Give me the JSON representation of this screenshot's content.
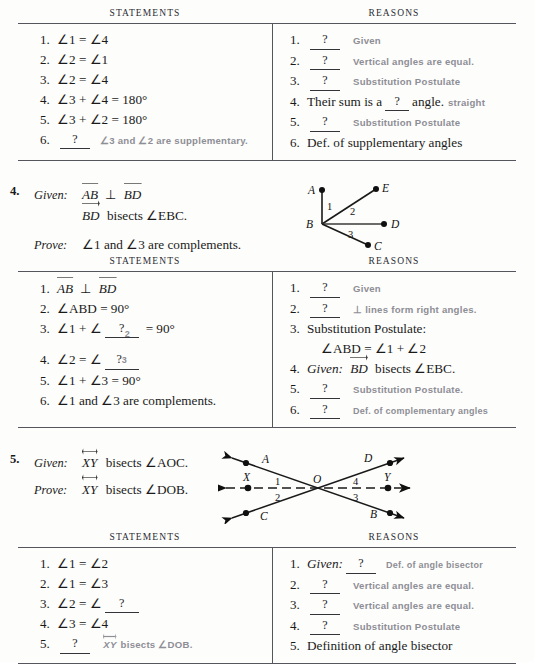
{
  "table_headers": {
    "statements": "STATEMENTS",
    "reasons": "REASONS"
  },
  "proof1": {
    "statements": [
      {
        "num": "1.",
        "text": "∠1 = ∠4"
      },
      {
        "num": "2.",
        "text": "∠2 = ∠1"
      },
      {
        "num": "3.",
        "text": "∠2 = ∠4"
      },
      {
        "num": "4.",
        "text": "∠3 + ∠4 = 180°"
      },
      {
        "num": "5.",
        "text": "∠3 + ∠2 = 180°"
      },
      {
        "num": "6.",
        "blank": "?",
        "answer": "∠3 and ∠2 are supplementary."
      }
    ],
    "reasons": [
      {
        "num": "1.",
        "blank": "?",
        "answer": "Given"
      },
      {
        "num": "2.",
        "blank": "?",
        "answer": "Vertical angles are equal."
      },
      {
        "num": "3.",
        "blank": "?",
        "answer": "Substitution Postulate"
      },
      {
        "num": "4.",
        "pre": "Their sum is a",
        "blank": "?",
        "post": "angle.",
        "answer": "straight"
      },
      {
        "num": "5.",
        "blank": "?",
        "answer": "Substitution Postulate"
      },
      {
        "num": "6.",
        "text": "Def. of supplementary angles"
      }
    ]
  },
  "problem4": {
    "number": "4.",
    "given_label": "Given:",
    "given_line1_a": "AB",
    "given_line1_perp": "⊥",
    "given_line1_b": "BD",
    "given_line2_ray": "BD",
    "given_line2_rest": "bisects ∠EBC.",
    "prove_label": "Prove:",
    "prove_text": "∠1 and ∠3 are complements.",
    "figure": {
      "points": [
        "A",
        "E",
        "B",
        "D",
        "C"
      ],
      "angle_labels": [
        "1",
        "2",
        "3"
      ]
    },
    "statements": [
      {
        "num": "1.",
        "seg1": "AB",
        "perp": "⊥",
        "seg2": "BD"
      },
      {
        "num": "2.",
        "text": "∠ABD = 90°"
      },
      {
        "num": "3.",
        "pre": "∠1 + ∠",
        "blank": "?",
        "post": "= 90°",
        "answer": "2"
      },
      {
        "num": "4.",
        "pre": "∠2 = ∠",
        "blank": "?",
        "answer": "3"
      },
      {
        "num": "5.",
        "text": "∠1 + ∠3 = 90°"
      },
      {
        "num": "6.",
        "text": "∠1 and ∠3 are complements."
      }
    ],
    "reasons": [
      {
        "num": "1.",
        "blank": "?",
        "answer": "Given"
      },
      {
        "num": "2.",
        "blank": "?",
        "answer": "⊥ lines form right angles."
      },
      {
        "num": "3.",
        "text": "Substitution Postulate:",
        "text2": "∠ABD = ∠1 + ∠2"
      },
      {
        "num": "4.",
        "given": "Given:",
        "ray": "BD",
        "rest": "bisects ∠EBC."
      },
      {
        "num": "5.",
        "blank": "?",
        "answer": "Substitution Postulate."
      },
      {
        "num": "6.",
        "blank": "?",
        "answer": "Def. of complementary angles"
      }
    ]
  },
  "problem5": {
    "number": "5.",
    "given_label": "Given:",
    "given_line": "XY",
    "given_rest": "bisects ∠AOC.",
    "prove_label": "Prove:",
    "prove_line": "XY",
    "prove_rest": "bisects ∠DOB.",
    "figure": {
      "points": [
        "A",
        "D",
        "X",
        "O",
        "Y",
        "C",
        "B"
      ],
      "angle_labels": [
        "1",
        "2",
        "3",
        "4"
      ]
    },
    "statements": [
      {
        "num": "1.",
        "text": "∠1 = ∠2"
      },
      {
        "num": "2.",
        "text": "∠1 = ∠3"
      },
      {
        "num": "3.",
        "pre": "∠2 = ∠",
        "blank": "?"
      },
      {
        "num": "4.",
        "text": "∠3 = ∠4"
      },
      {
        "num": "5.",
        "blank": "?",
        "line": "XY",
        "answer_rest": "bisects ∠DOB."
      }
    ],
    "reasons": [
      {
        "num": "1.",
        "given": "Given:",
        "blank": "?",
        "answer": "Def. of angle bisector"
      },
      {
        "num": "2.",
        "blank": "?",
        "answer": "Vertical angles are equal."
      },
      {
        "num": "3.",
        "blank": "?",
        "answer": "Vertical angles are equal."
      },
      {
        "num": "4.",
        "blank": "?",
        "answer": "Substitution Postulate"
      },
      {
        "num": "5.",
        "text": "Definition of angle bisector"
      }
    ]
  },
  "colors": {
    "ink": "#1a1a1a",
    "pencil_gray": "#8e8e96",
    "rule": "#55555d",
    "paper": "#fdfdfb"
  }
}
